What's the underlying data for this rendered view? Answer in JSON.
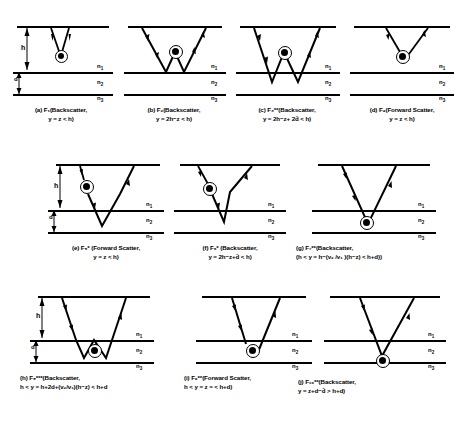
{
  "figure": {
    "layer_labels": {
      "top": "n",
      "top_sub": "1",
      "mid": "n",
      "mid_sub": "2",
      "bot": "n",
      "bot_sub": "3"
    },
    "dimension_labels": {
      "height": "h",
      "depth": "d"
    },
    "ink_color": "#000000",
    "background_color": "#ffffff"
  },
  "panels": [
    {
      "id": "a",
      "tag": "(a)",
      "symbol": "F",
      "symbol_sub": "1",
      "symbol_sup": "",
      "type": "Backscatter",
      "line1": "(a)  F₁(Backscatter,",
      "line2": "y = z < h)",
      "condition": "y = z < h",
      "has_h_arrow": true,
      "has_d_arrow": true
    },
    {
      "id": "b",
      "tag": "(b)",
      "symbol": "F",
      "symbol_sub": "2",
      "symbol_sup": "",
      "type": "Backscatter",
      "line1": "(b)  F₂(Backscatter,",
      "line2": "y = 2h−z < h)",
      "condition": "y = 2h-z < h",
      "has_h_arrow": false,
      "has_d_arrow": false
    },
    {
      "id": "c",
      "tag": "(c)",
      "symbol": "F",
      "symbol_sub": "3",
      "symbol_sup": "**",
      "type": "Backscatter",
      "line1": "(c)  F₃**(Backscatter,",
      "line2": "y = 2h−z+ 2d̃ < h)",
      "condition": "y = 2h-z+2d~ < h",
      "has_h_arrow": false,
      "has_d_arrow": false
    },
    {
      "id": "d",
      "tag": "(d)",
      "symbol": "F",
      "symbol_sub": "4",
      "symbol_sup": "",
      "type": "Forward Scatter",
      "line1": "(d)  F₄(Forward Scatter,",
      "line2": "y = z < h)",
      "condition": "y = z < h",
      "has_h_arrow": false,
      "has_d_arrow": false
    },
    {
      "id": "e",
      "tag": "(e)",
      "symbol": "F",
      "symbol_sub": "5",
      "symbol_sup": "*",
      "type": "Forward Scatter",
      "line1": "(e)  F₅* (Forward Scatter,",
      "line2": "y = z < h)",
      "condition": "y = z < h",
      "has_h_arrow": true,
      "has_d_arrow": true
    },
    {
      "id": "f",
      "tag": "(f)",
      "symbol": "F",
      "symbol_sub": "6",
      "symbol_sup": "*",
      "type": "Backscatter",
      "line1": "(f)  F₆* (Backscatter,",
      "line2": "y = 2h−z+d̃ < h)",
      "condition": "y = 2h-z+d~ < h",
      "has_h_arrow": false,
      "has_d_arrow": false
    },
    {
      "id": "g",
      "tag": "(g)",
      "symbol": "F",
      "symbol_sub": "7",
      "symbol_sup": "**",
      "type": "Backscatter",
      "line1": "(g)  F₇**(Backscatter,",
      "line2": "(h < y = h−(v₂ /v₁ )(h−z) < h+d))",
      "condition": "h < y = h-(v2/v1)(h-z) < h+d",
      "has_h_arrow": false,
      "has_d_arrow": false
    },
    {
      "id": "h",
      "tag": "(h)",
      "symbol": "F",
      "symbol_sub": "8",
      "symbol_sup": "***",
      "type": "Backscatter",
      "line1": "(h)  F₈***(Backscatter,",
      "line2": "h < y = h+2d+(v₂/v₁)(h−z) < h+d",
      "condition": "h < y = h+2d+(v2/v1)(h-z) < h+d",
      "has_h_arrow": true,
      "has_d_arrow": true
    },
    {
      "id": "i",
      "tag": "(i)",
      "symbol": "F",
      "symbol_sub": "9",
      "symbol_sup": "**",
      "type": "Forward Scatter",
      "line1": "(i)  F₉**(Forward Scatter,",
      "line2": "h < y = z = < h+d)",
      "condition": "h < y = z = < h+d",
      "has_h_arrow": false,
      "has_d_arrow": false
    },
    {
      "id": "j",
      "tag": "(j)",
      "symbol": "F",
      "symbol_sub": "10",
      "symbol_sup": "**",
      "type": "Backscatter",
      "line1": "(j)  F₁₀**(Backscatter,",
      "line2": "y = z+d−d̃ > h+d)",
      "condition": "y = z+d-d~ > h+d",
      "has_h_arrow": false,
      "has_d_arrow": false
    }
  ]
}
